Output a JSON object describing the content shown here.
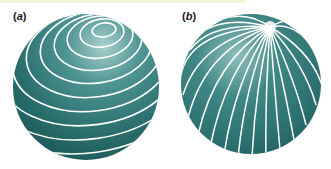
{
  "figure": {
    "panels": [
      {
        "id": "a",
        "label_open": "(",
        "label_letter": "a",
        "label_close": ")",
        "description": "sphere with concentric circular lines (latitude-like)"
      },
      {
        "id": "b",
        "label_open": "(",
        "label_letter": "b",
        "label_close": ")",
        "description": "sphere with lines converging at a pole (longitude-like)"
      }
    ],
    "colors": {
      "sphere_dark": "#1f5f5e",
      "sphere_mid": "#2f7b79",
      "sphere_light": "#a9cfcc",
      "lines": "#ffffff",
      "top_strip": "#eef6d8"
    }
  }
}
